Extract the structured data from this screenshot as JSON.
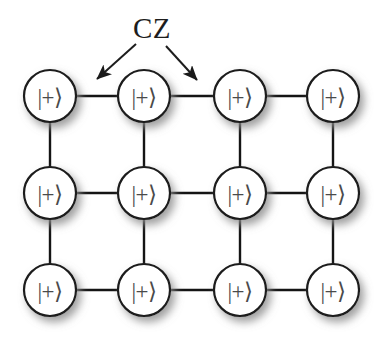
{
  "figure": {
    "background_color": "#ffffff"
  },
  "annotation": {
    "label": "CZ",
    "label_x": 152,
    "label_y": 28,
    "color": "#1d1d1d",
    "arrows": [
      {
        "name": "arrow-left",
        "x1": 136,
        "y1": 44,
        "x2": 97,
        "y2": 79
      },
      {
        "name": "arrow-right",
        "x1": 166,
        "y1": 46,
        "x2": 197,
        "y2": 80
      }
    ]
  },
  "lattice": {
    "columns": 4,
    "rows": 3,
    "column_x": [
      50,
      144,
      240,
      333
    ],
    "row_y": [
      96,
      193,
      290
    ],
    "node_radius": 26,
    "node_fill": "#ffffff",
    "node_stroke": "#1a1a1a",
    "node_stroke_width": 2.2,
    "edge_color": "#141414",
    "edge_width": 2.4,
    "shadow_color": "#9a9a9a",
    "node_state_label": "|+⟩",
    "nodes": [
      {
        "id": "q-r1c1",
        "row": 1,
        "col": 1,
        "x": 50,
        "y": 96,
        "label": "|+⟩"
      },
      {
        "id": "q-r1c2",
        "row": 1,
        "col": 2,
        "x": 144,
        "y": 96,
        "label": "|+⟩"
      },
      {
        "id": "q-r1c3",
        "row": 1,
        "col": 3,
        "x": 240,
        "y": 96,
        "label": "|+⟩"
      },
      {
        "id": "q-r1c4",
        "row": 1,
        "col": 4,
        "x": 333,
        "y": 96,
        "label": "|+⟩"
      },
      {
        "id": "q-r2c1",
        "row": 2,
        "col": 1,
        "x": 50,
        "y": 193,
        "label": "|+⟩"
      },
      {
        "id": "q-r2c2",
        "row": 2,
        "col": 2,
        "x": 144,
        "y": 193,
        "label": "|+⟩"
      },
      {
        "id": "q-r2c3",
        "row": 2,
        "col": 3,
        "x": 240,
        "y": 193,
        "label": "|+⟩"
      },
      {
        "id": "q-r2c4",
        "row": 2,
        "col": 4,
        "x": 333,
        "y": 193,
        "label": "|+⟩"
      },
      {
        "id": "q-r3c1",
        "row": 3,
        "col": 1,
        "x": 50,
        "y": 290,
        "label": "|+⟩"
      },
      {
        "id": "q-r3c2",
        "row": 3,
        "col": 2,
        "x": 144,
        "y": 290,
        "label": "|+⟩"
      },
      {
        "id": "q-r3c3",
        "row": 3,
        "col": 3,
        "x": 240,
        "y": 290,
        "label": "|+⟩"
      },
      {
        "id": "q-r3c4",
        "row": 3,
        "col": 4,
        "x": 333,
        "y": 290,
        "label": "|+⟩"
      }
    ],
    "edges": [
      {
        "id": "e-h-r1-12",
        "x1": 50,
        "y1": 96,
        "x2": 144,
        "y2": 96,
        "orientation": "horizontal"
      },
      {
        "id": "e-h-r1-23",
        "x1": 144,
        "y1": 96,
        "x2": 240,
        "y2": 96,
        "orientation": "horizontal"
      },
      {
        "id": "e-h-r1-34",
        "x1": 240,
        "y1": 96,
        "x2": 333,
        "y2": 96,
        "orientation": "horizontal"
      },
      {
        "id": "e-h-r2-12",
        "x1": 50,
        "y1": 193,
        "x2": 144,
        "y2": 193,
        "orientation": "horizontal"
      },
      {
        "id": "e-h-r2-23",
        "x1": 144,
        "y1": 193,
        "x2": 240,
        "y2": 193,
        "orientation": "horizontal"
      },
      {
        "id": "e-h-r2-34",
        "x1": 240,
        "y1": 193,
        "x2": 333,
        "y2": 193,
        "orientation": "horizontal"
      },
      {
        "id": "e-h-r3-12",
        "x1": 50,
        "y1": 290,
        "x2": 144,
        "y2": 290,
        "orientation": "horizontal"
      },
      {
        "id": "e-h-r3-23",
        "x1": 144,
        "y1": 290,
        "x2": 240,
        "y2": 290,
        "orientation": "horizontal"
      },
      {
        "id": "e-h-r3-34",
        "x1": 240,
        "y1": 290,
        "x2": 333,
        "y2": 290,
        "orientation": "horizontal"
      },
      {
        "id": "e-v-c1-12",
        "x1": 50,
        "y1": 96,
        "x2": 50,
        "y2": 193,
        "orientation": "vertical"
      },
      {
        "id": "e-v-c2-12",
        "x1": 144,
        "y1": 96,
        "x2": 144,
        "y2": 193,
        "orientation": "vertical"
      },
      {
        "id": "e-v-c3-12",
        "x1": 240,
        "y1": 96,
        "x2": 240,
        "y2": 193,
        "orientation": "vertical"
      },
      {
        "id": "e-v-c4-12",
        "x1": 333,
        "y1": 96,
        "x2": 333,
        "y2": 193,
        "orientation": "vertical"
      },
      {
        "id": "e-v-c1-23",
        "x1": 50,
        "y1": 193,
        "x2": 50,
        "y2": 290,
        "orientation": "vertical"
      },
      {
        "id": "e-v-c2-23",
        "x1": 144,
        "y1": 193,
        "x2": 144,
        "y2": 290,
        "orientation": "vertical"
      },
      {
        "id": "e-v-c3-23",
        "x1": 240,
        "y1": 193,
        "x2": 240,
        "y2": 290,
        "orientation": "vertical"
      },
      {
        "id": "e-v-c4-23",
        "x1": 333,
        "y1": 193,
        "x2": 333,
        "y2": 290,
        "orientation": "vertical"
      }
    ]
  }
}
